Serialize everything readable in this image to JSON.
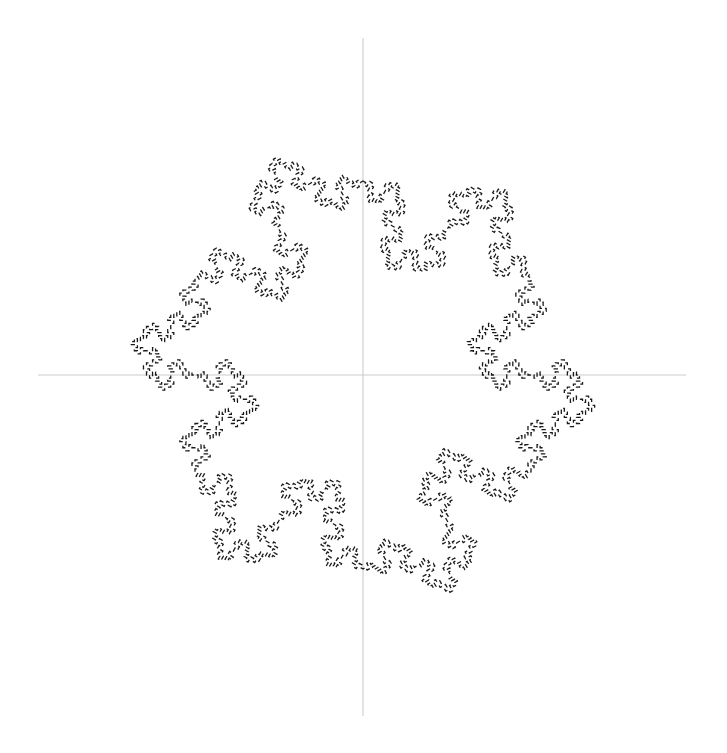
{
  "figure": {
    "title": "",
    "background_color": "#ffffff",
    "width": 727,
    "height": 753
  },
  "axes": {
    "show": true,
    "color": "#cccccc",
    "line_width": 1.1,
    "horizontal": {
      "name": "x-axis",
      "y": 375,
      "x_start": 38,
      "x_end": 686
    },
    "vertical": {
      "name": "y-axis",
      "x": 363,
      "y_start": 38,
      "y_end": 716
    },
    "origin": {
      "x": 363,
      "y": 375
    },
    "tick_labels_x": [],
    "tick_labels_y": []
  },
  "chart_data": {
    "type": "line",
    "title": "",
    "subtitle": "",
    "xlabel": "",
    "ylabel": "",
    "legend": [],
    "grid": false,
    "annotations": [],
    "xlim": [
      -1.45,
      1.45
    ],
    "ylim": [
      -1.5,
      1.5
    ],
    "curve": {
      "name": "quadratic-koch-snowflake",
      "symmetry_order": 6,
      "iterations": 3,
      "closed": true,
      "stroke_color": "#1a1a1a",
      "stroke_width": 1.3,
      "dash_pattern": [
        4.4,
        3.0
      ],
      "generator": "minkowski-square-island",
      "base_polygon": "hexagon",
      "center": {
        "x": 363,
        "y": 375
      },
      "circumradius_px": 194,
      "base_vertices_px": [
        {
          "x": 363.0,
          "y": 181.0
        },
        {
          "x": 531.0,
          "y": 278.0
        },
        {
          "x": 531.0,
          "y": 472.0
        },
        {
          "x": 363.0,
          "y": 569.0
        },
        {
          "x": 195.0,
          "y": 472.0
        },
        {
          "x": 195.0,
          "y": 278.0
        }
      ],
      "convergence_points_px": [
        {
          "x": 363,
          "y": 181
        },
        {
          "x": 489,
          "y": 241
        },
        {
          "x": 543,
          "y": 375
        },
        {
          "x": 489,
          "y": 509
        },
        {
          "x": 363,
          "y": 569
        },
        {
          "x": 232,
          "y": 509
        },
        {
          "x": 175,
          "y": 375
        },
        {
          "x": 232,
          "y": 242
        }
      ],
      "extent_px": {
        "left": 50,
        "right": 678,
        "top": 57,
        "bottom": 697
      }
    }
  }
}
